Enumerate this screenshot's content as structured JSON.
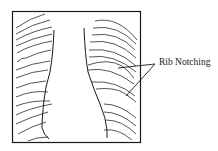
{
  "figure": {
    "type": "schematic chest radiograph",
    "annotation": {
      "label": "Rib Notching",
      "arrow_count": 2
    },
    "colors": {
      "line": "#1a1a1a",
      "background": "#ffffff"
    }
  }
}
